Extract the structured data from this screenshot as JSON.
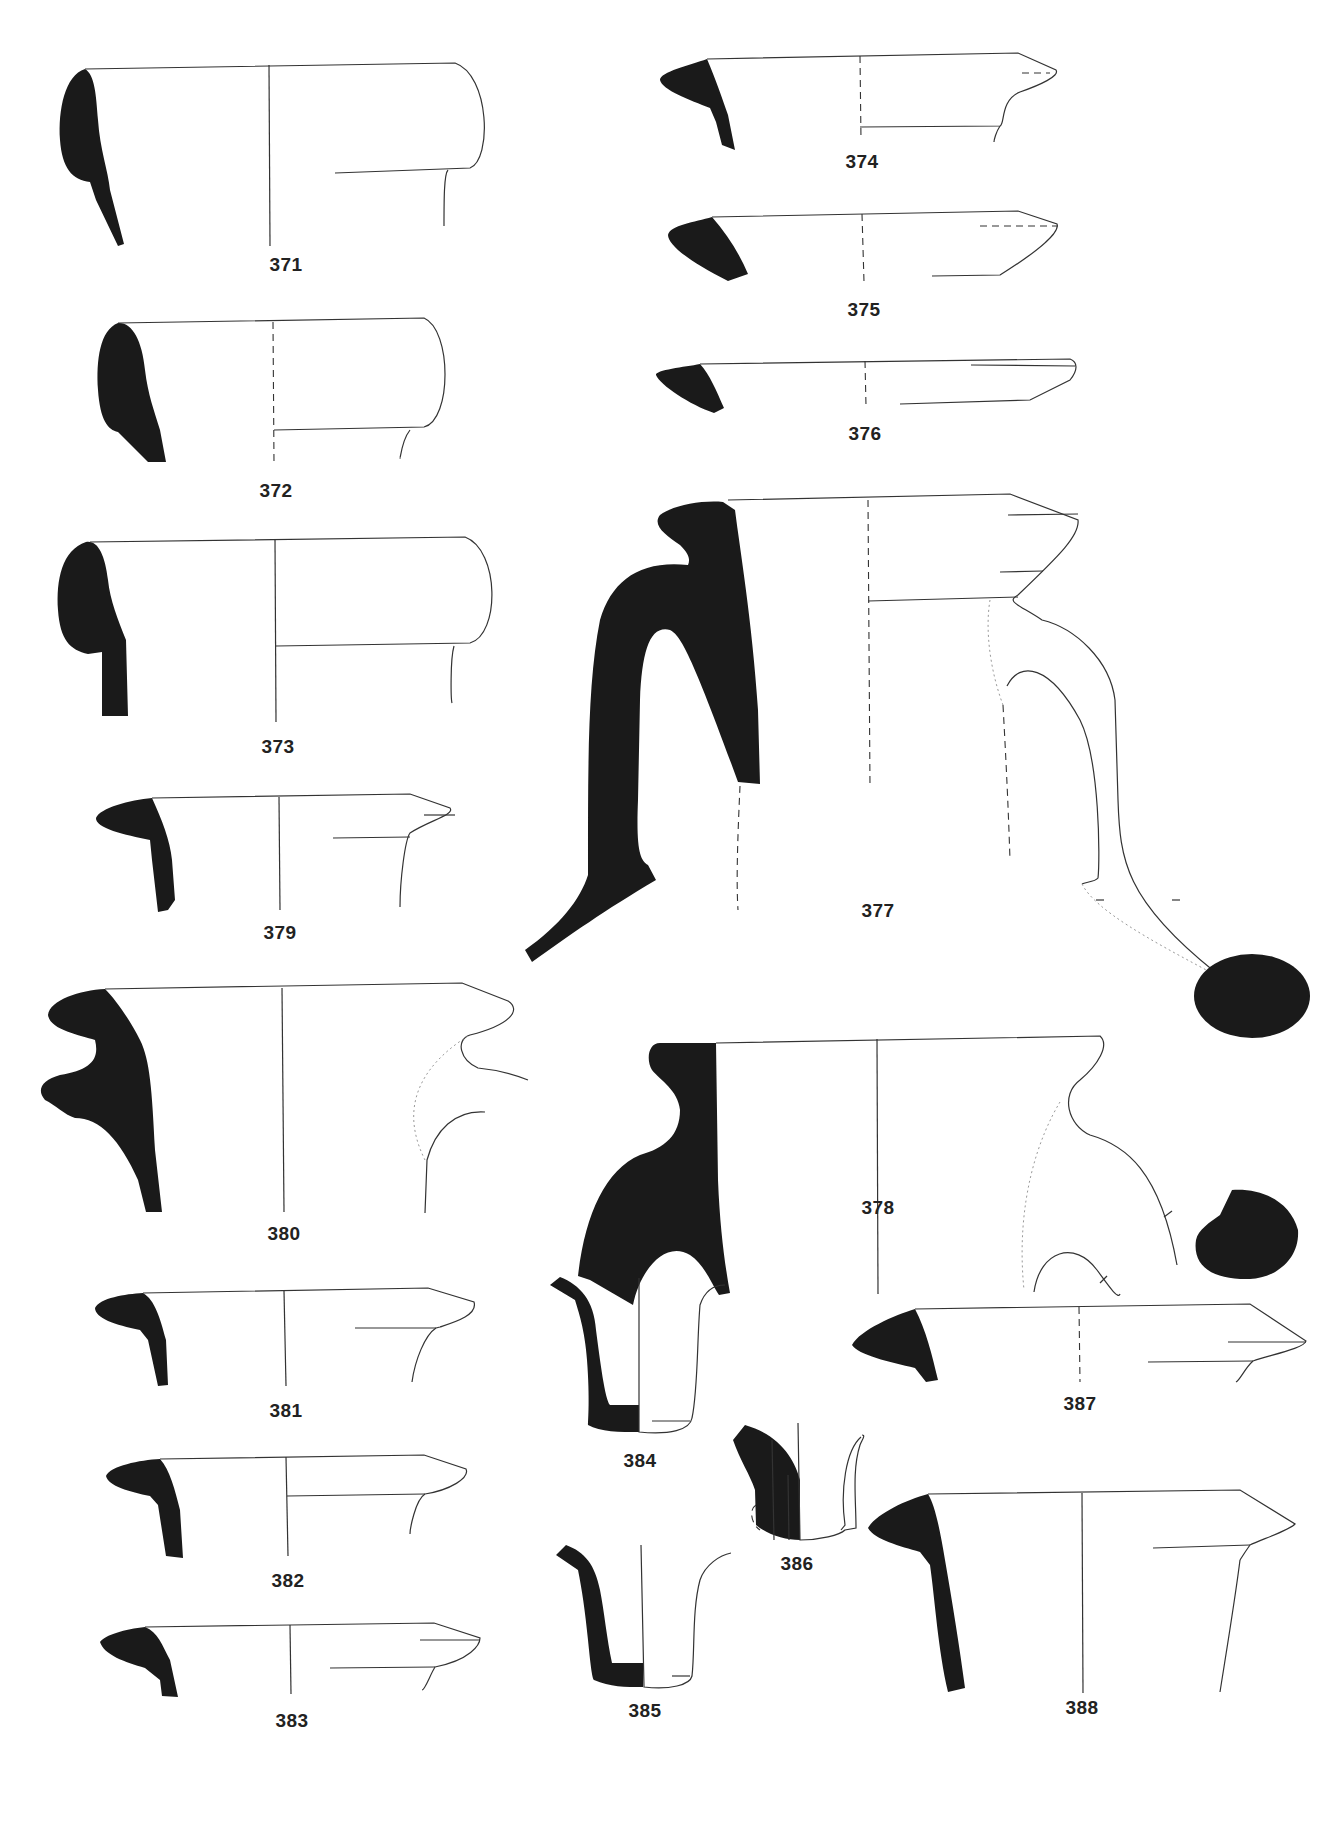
{
  "plate": {
    "type": "pottery profile drawings (rim and base sherds)",
    "background": "#ffffff",
    "section_fill": "#1a1a1a",
    "line_color": "#333333"
  },
  "figures": [
    {
      "id": "371",
      "label": "371",
      "kind": "rim",
      "label_pos": [
        286,
        266
      ]
    },
    {
      "id": "372",
      "label": "372",
      "kind": "rim",
      "label_pos": [
        276,
        492
      ]
    },
    {
      "id": "373",
      "label": "373",
      "kind": "rim",
      "label_pos": [
        278,
        747
      ]
    },
    {
      "id": "374",
      "label": "374",
      "kind": "rim",
      "label_pos": [
        862,
        163
      ]
    },
    {
      "id": "375",
      "label": "375",
      "kind": "rim",
      "label_pos": [
        864,
        310
      ]
    },
    {
      "id": "376",
      "label": "376",
      "kind": "rim",
      "label_pos": [
        865,
        434
      ]
    },
    {
      "id": "377",
      "label": "377",
      "kind": "jug with handle",
      "label_pos": [
        878,
        912
      ]
    },
    {
      "id": "378",
      "label": "378",
      "kind": "jug with handle",
      "label_pos": [
        878,
        1209
      ]
    },
    {
      "id": "379",
      "label": "379",
      "kind": "rim",
      "label_pos": [
        280,
        933
      ]
    },
    {
      "id": "380",
      "label": "380",
      "kind": "rim with handle",
      "label_pos": [
        284,
        1235
      ]
    },
    {
      "id": "381",
      "label": "381",
      "kind": "rim",
      "label_pos": [
        286,
        1412
      ]
    },
    {
      "id": "382",
      "label": "382",
      "kind": "rim",
      "label_pos": [
        288,
        1582
      ]
    },
    {
      "id": "383",
      "label": "383",
      "kind": "rim",
      "label_pos": [
        292,
        1722
      ]
    },
    {
      "id": "384",
      "label": "384",
      "kind": "base",
      "label_pos": [
        640,
        1462
      ]
    },
    {
      "id": "385",
      "label": "385",
      "kind": "base",
      "label_pos": [
        645,
        1712
      ]
    },
    {
      "id": "386",
      "label": "386",
      "kind": "base",
      "label_pos": [
        797,
        1565
      ]
    },
    {
      "id": "387",
      "label": "387",
      "kind": "rim",
      "label_pos": [
        1080,
        1405
      ]
    },
    {
      "id": "388",
      "label": "388",
      "kind": "rim",
      "label_pos": [
        1082,
        1709
      ]
    }
  ]
}
